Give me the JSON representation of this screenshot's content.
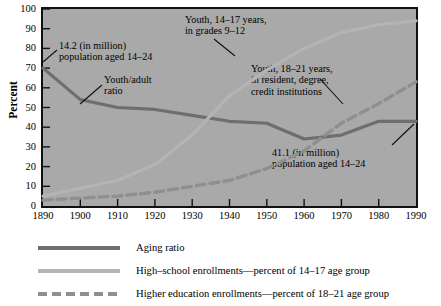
{
  "chart_data": {
    "type": "line",
    "title": "",
    "xlabel": "",
    "ylabel": "Percent",
    "xlim": [
      1890,
      1990
    ],
    "ylim": [
      0,
      100
    ],
    "grid": false,
    "legend_position": "bottom",
    "x": [
      1890,
      1900,
      1910,
      1920,
      1930,
      1940,
      1950,
      1960,
      1970,
      1980,
      1990
    ],
    "xticklabels": [
      "1890",
      "1900",
      "1910",
      "1920",
      "1930",
      "1940",
      "1950",
      "1960",
      "1970",
      "1980",
      "1990"
    ],
    "yticklabels": [
      "0",
      "10",
      "20",
      "30",
      "40",
      "50",
      "60",
      "70",
      "80",
      "90",
      "100"
    ],
    "series": [
      {
        "name": "Aging ratio",
        "style": "solid",
        "color": "#6e6e6e",
        "values": [
          70,
          54,
          50,
          49,
          46,
          43,
          42,
          34,
          36,
          43,
          43
        ]
      },
      {
        "name": "High-school enrollments—percent of 14–17 age group",
        "style": "solid",
        "color": "#b4b4b4",
        "values": [
          5,
          9,
          13,
          21,
          36,
          56,
          69,
          80,
          88,
          92,
          94
        ]
      },
      {
        "name": "Higher education enrollments—percent of 18–21 age group",
        "style": "dashed",
        "color": "#8f8f8f",
        "values": [
          3,
          4,
          5,
          7,
          10,
          13,
          19,
          28,
          42,
          52,
          63
        ]
      }
    ],
    "annotations": [
      {
        "id": "pop-1890",
        "lines": [
          "14.2 (in million)",
          "population aged 14–24"
        ],
        "points_to": "aging ratio value at 1890"
      },
      {
        "id": "youth-adult-ratio",
        "lines": [
          "Youth/adult",
          "ratio"
        ],
        "points_to": "aging ratio curve near 1910"
      },
      {
        "id": "youth-14-17",
        "lines": [
          "Youth, 14–17 years,",
          "in grades 9–12"
        ],
        "points_to": "high-school enrollments curve"
      },
      {
        "id": "youth-18-21",
        "lines": [
          "Youth, 18–21 years,",
          "in resident, degree,",
          "credit institutions"
        ],
        "points_to": "higher education enrollments curve"
      },
      {
        "id": "pop-1990",
        "lines": [
          "41.1 (in million)",
          "population aged 14–24"
        ],
        "points_to": "aging ratio value at 1990"
      }
    ]
  },
  "legend": {
    "items": [
      {
        "label": "Aging ratio",
        "style": "solid-dark"
      },
      {
        "label": "High–school enrollments—percent of 14–17 age group",
        "style": "solid-light"
      },
      {
        "label": "Higher education enrollments—percent of 18–21 age group",
        "style": "dashed"
      }
    ]
  }
}
